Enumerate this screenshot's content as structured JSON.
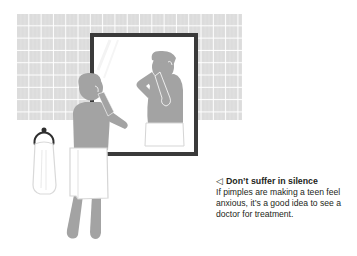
{
  "illustration": {
    "description": "Teenager with a towel around his waist looking at pimples in a bathroom mirror",
    "colors": {
      "tile": "#dcdcdc",
      "grout": "#ffffff",
      "figure": "#a3a3a3",
      "towel_outline": "#d9d9d9",
      "mirror_frame": "#3a3a3a",
      "ring": "#2f2f2f"
    }
  },
  "caption": {
    "arrow_icon": "◁",
    "title": "Don’t suffer in silence",
    "body": "If pimples are making a teen feel anxious, it’s a good idea to see a doctor for treatment."
  }
}
